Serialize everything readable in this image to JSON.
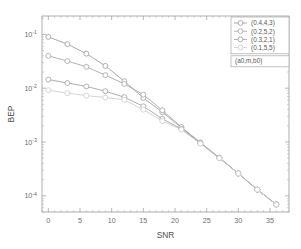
{
  "figure": {
    "background": "#ffffff",
    "plot_background": "#ffffff",
    "axis_color": "#9a9a9a"
  },
  "axis_titles": {
    "x": "SNR",
    "y": "BEP"
  },
  "x_ticks": [
    "0",
    "5",
    "10",
    "15",
    "20",
    "25",
    "30",
    "35"
  ],
  "y_ticks": [
    "10-1",
    "10-2",
    "10-3",
    "10-4"
  ],
  "y_tick_mantissa": "10",
  "y_tick_exponents": [
    "-1",
    "-2",
    "-3",
    "-4"
  ],
  "legend": {
    "entries": [
      {
        "label": "(0.4,4,3)",
        "color": "#9a9a9a"
      },
      {
        "label": "(0.2,5,2)",
        "color": "#a5a5a5"
      },
      {
        "label": "(0.3,2,1)",
        "color": "#9f9f9f"
      },
      {
        "label": "(0.1,5,5)",
        "color": "#cbcbcb"
      }
    ],
    "annotation_box": "(a0,m,b0)"
  },
  "chart_data": {
    "type": "line",
    "title": "",
    "xlabel": "SNR",
    "ylabel": "BEP",
    "xlim": [
      -1,
      38
    ],
    "ylim": [
      5e-05,
      0.22
    ],
    "yscale": "log",
    "xscale": "linear",
    "grid": false,
    "legend_position": "upper right",
    "legend_title": "(a0,m,b0)",
    "marker": "circle",
    "x": [
      0,
      3,
      6,
      9,
      12,
      15,
      18,
      21,
      24,
      27,
      30,
      33,
      36
    ],
    "series": [
      {
        "name": "(0.4,4,3)",
        "color": "#9a9a9a",
        "values": [
          0.09,
          0.066,
          0.044,
          0.026,
          0.0135,
          0.0066,
          0.0036,
          0.00185,
          0.00097,
          0.00051,
          0.00026,
          0.00013,
          6.9e-05
        ]
      },
      {
        "name": "(0.2,5,2)",
        "color": "#a5a5a5",
        "values": [
          0.04,
          0.032,
          0.025,
          0.0175,
          0.012,
          0.0076,
          0.0039,
          0.0019,
          0.00098,
          0.00051,
          0.00026,
          0.00013,
          6.9e-05
        ]
      },
      {
        "name": "(0.3,2,1)",
        "color": "#9f9f9f",
        "values": [
          0.0145,
          0.0125,
          0.0108,
          0.0088,
          0.0068,
          0.0046,
          0.0027,
          0.00175,
          0.00095,
          0.0005,
          0.00026,
          0.00013,
          6.9e-05
        ]
      },
      {
        "name": "(0.1,5,5)",
        "color": "#cbcbcb",
        "values": [
          0.0092,
          0.0081,
          0.0073,
          0.0067,
          0.0061,
          0.004,
          0.00245,
          0.0017,
          0.00094,
          0.0005,
          0.00026,
          0.00013,
          6.9e-05
        ]
      }
    ]
  }
}
